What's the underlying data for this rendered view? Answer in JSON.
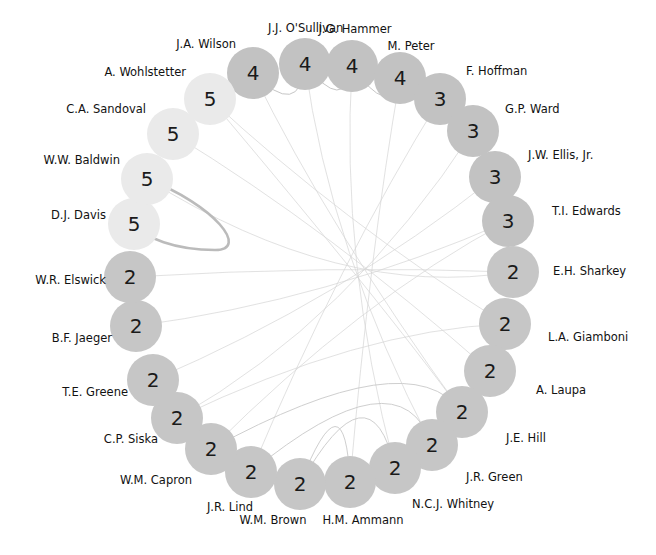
{
  "figure": {
    "type": "circular-network-graph",
    "background": "#ffffff",
    "node_text_color": "#1a1a1a",
    "label_text_color": "#121212",
    "edge_color": "#b9b9b9",
    "center": {
      "x": 311,
      "y": 268
    },
    "ring_radius": 185,
    "node_radius": 26
  },
  "palette": {
    "value_5": "#eaeaea",
    "value_4": "#c2c2c2",
    "value_3": "#c2c2c2",
    "value_2": "#c6c6c6"
  },
  "chart_data": {
    "type": "scatter",
    "title": "",
    "xlabel": "",
    "ylabel": "",
    "legend": [],
    "categories": [
      "J.J. O'Sullivan",
      "J.G. Hammer",
      "M. Peter",
      "F. Hoffman",
      "G.P. Ward",
      "J.W. Ellis, Jr.",
      "T.I. Edwards",
      "E.H. Sharkey",
      "L.A. Giamboni",
      "A. Laupa",
      "J.E. Hill",
      "J.R. Green",
      "N.C.J. Whitney",
      "H.M. Ammann",
      "W.M. Brown",
      "J.R. Lind",
      "W.M. Capron",
      "C.P. Siska",
      "T.E. Greene",
      "B.F. Jaeger",
      "W.R. Elswick",
      "D.J. Davis",
      "W.W. Baldwin",
      "C.A. Sandoval",
      "A. Wohlstetter",
      "J.A. Wilson"
    ],
    "values": [
      4,
      4,
      4,
      3,
      3,
      3,
      3,
      2,
      2,
      2,
      2,
      2,
      2,
      2,
      2,
      2,
      2,
      2,
      2,
      2,
      2,
      5,
      5,
      5,
      5,
      5
    ]
  },
  "nodes": [
    {
      "name": "J.A. Wilson",
      "value": "4",
      "x": 253,
      "y": 73,
      "tone": "value_4",
      "label_x": 236,
      "label_y": 45,
      "align": "l"
    },
    {
      "name": "J.J. O'Sullivan",
      "value": "4",
      "x": 305,
      "y": 64,
      "tone": "value_4",
      "label_x": 268,
      "label_y": 29,
      "align": "r"
    },
    {
      "name": "J.G. Hammer",
      "value": "4",
      "x": 352,
      "y": 66,
      "tone": "value_4",
      "label_x": 355,
      "label_y": 30,
      "align": "c"
    },
    {
      "name": "M. Peter",
      "value": "4",
      "x": 400,
      "y": 78,
      "tone": "value_4",
      "label_x": 411,
      "label_y": 47,
      "align": "c"
    },
    {
      "name": "F. Hoffman",
      "value": "3",
      "x": 440,
      "y": 99,
      "tone": "value_3",
      "label_x": 466,
      "label_y": 72,
      "align": "r"
    },
    {
      "name": "G.P. Ward",
      "value": "3",
      "x": 473,
      "y": 131,
      "tone": "value_3",
      "label_x": 505,
      "label_y": 110,
      "align": "r"
    },
    {
      "name": "J.W. Ellis, Jr.",
      "value": "3",
      "x": 495,
      "y": 177,
      "tone": "value_3",
      "label_x": 528,
      "label_y": 156,
      "align": "r"
    },
    {
      "name": "T.I. Edwards",
      "value": "3",
      "x": 508,
      "y": 221,
      "tone": "value_3",
      "label_x": 552,
      "label_y": 212,
      "align": "r"
    },
    {
      "name": "E.H. Sharkey",
      "value": "2",
      "x": 513,
      "y": 272,
      "tone": "value_2",
      "label_x": 553,
      "label_y": 272,
      "align": "r"
    },
    {
      "name": "L.A. Giamboni",
      "value": "2",
      "x": 505,
      "y": 324,
      "tone": "value_2",
      "label_x": 548,
      "label_y": 338,
      "align": "r"
    },
    {
      "name": "A. Laupa",
      "value": "2",
      "x": 490,
      "y": 371,
      "tone": "value_2",
      "label_x": 536,
      "label_y": 391,
      "align": "r"
    },
    {
      "name": "J.E. Hill",
      "value": "2",
      "x": 462,
      "y": 412,
      "tone": "value_2",
      "label_x": 506,
      "label_y": 439,
      "align": "r"
    },
    {
      "name": "J.R. Green",
      "value": "2",
      "x": 432,
      "y": 445,
      "tone": "value_2",
      "label_x": 466,
      "label_y": 478,
      "align": "r"
    },
    {
      "name": "N.C.J. Whitney",
      "value": "2",
      "x": 395,
      "y": 468,
      "tone": "value_2",
      "label_x": 412,
      "label_y": 505,
      "align": "r"
    },
    {
      "name": "H.M. Ammann",
      "value": "2",
      "x": 350,
      "y": 482,
      "tone": "value_2",
      "label_x": 363,
      "label_y": 521,
      "align": "c"
    },
    {
      "name": "W.M. Brown",
      "value": "2",
      "x": 300,
      "y": 484,
      "tone": "value_2",
      "label_x": 273,
      "label_y": 521,
      "align": "c"
    },
    {
      "name": "J.R. Lind",
      "value": "2",
      "x": 251,
      "y": 472,
      "tone": "value_2",
      "label_x": 230,
      "label_y": 508,
      "align": "c"
    },
    {
      "name": "W.M. Capron",
      "value": "2",
      "x": 211,
      "y": 449,
      "tone": "value_2",
      "label_x": 192,
      "label_y": 481,
      "align": "l"
    },
    {
      "name": "C.P. Siska",
      "value": "2",
      "x": 177,
      "y": 418,
      "tone": "value_2",
      "label_x": 158,
      "label_y": 440,
      "align": "l"
    },
    {
      "name": "T.E. Greene",
      "value": "2",
      "x": 153,
      "y": 380,
      "tone": "value_2",
      "label_x": 128,
      "label_y": 393,
      "align": "l"
    },
    {
      "name": "B.F. Jaeger",
      "value": "2",
      "x": 136,
      "y": 326,
      "tone": "value_2",
      "label_x": 112,
      "label_y": 339,
      "align": "l"
    },
    {
      "name": "W.R. Elswick",
      "value": "2",
      "x": 130,
      "y": 277,
      "tone": "value_2",
      "label_x": 106,
      "label_y": 281,
      "align": "l"
    },
    {
      "name": "D.J. Davis",
      "value": "5",
      "x": 134,
      "y": 224,
      "tone": "value_5",
      "label_x": 106,
      "label_y": 216,
      "align": "l"
    },
    {
      "name": "W.W. Baldwin",
      "value": "5",
      "x": 147,
      "y": 179,
      "tone": "value_5",
      "label_x": 120,
      "label_y": 161,
      "align": "l"
    },
    {
      "name": "C.A. Sandoval",
      "value": "5",
      "x": 173,
      "y": 134,
      "tone": "value_5",
      "label_x": 146,
      "label_y": 110,
      "align": "l"
    },
    {
      "name": "A. Wohlstetter",
      "value": "5",
      "x": 210,
      "y": 99,
      "tone": "value_5",
      "label_x": 186,
      "label_y": 73,
      "align": "l"
    }
  ],
  "edges": {
    "thick_arc": {
      "from": "W.W. Baldwin",
      "to": "D.J. Davis",
      "weight": "heavy"
    },
    "faint_chords": "interior chords connecting distant nodes"
  }
}
